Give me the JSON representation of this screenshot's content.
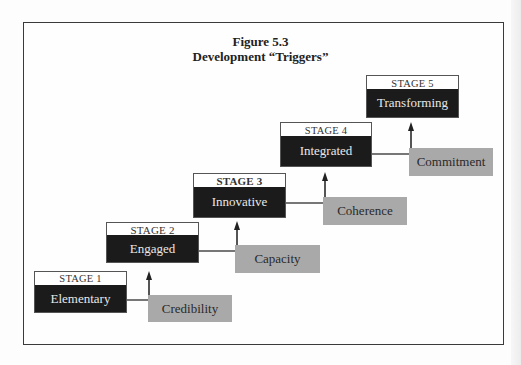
{
  "figure": {
    "number_label": "Figure 5.3",
    "title": "Development “Triggers”"
  },
  "stages": [
    {
      "label": "STAGE 1",
      "name": "Elementary"
    },
    {
      "label": "STAGE 2",
      "name": "Engaged"
    },
    {
      "label": "STAGE 3",
      "name": "Innovative"
    },
    {
      "label": "STAGE 4",
      "name": "Integrated"
    },
    {
      "label": "STAGE 5",
      "name": "Transforming"
    }
  ],
  "triggers": [
    {
      "name": "Credibility",
      "from_stage": 1,
      "to_stage": 2
    },
    {
      "name": "Capacity",
      "from_stage": 2,
      "to_stage": 3
    },
    {
      "name": "Coherence",
      "from_stage": 3,
      "to_stage": 4
    },
    {
      "name": "Commitment",
      "from_stage": 4,
      "to_stage": 5
    }
  ],
  "colors": {
    "stage_name_bg": "#1b1b1b",
    "stage_name_text": "#e8e8e8",
    "trigger_bg": "#a9a9a9",
    "frame_border": "#3a3a3a"
  }
}
